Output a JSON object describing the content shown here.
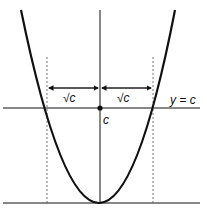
{
  "diagram": {
    "labels": {
      "sqrt_left": "√c",
      "sqrt_right": "√c",
      "line_label": "y = c",
      "point_label": "c"
    },
    "colors": {
      "stroke": "#111111",
      "background": "#ffffff"
    }
  }
}
